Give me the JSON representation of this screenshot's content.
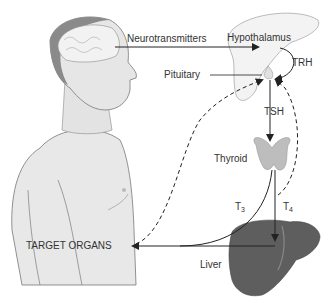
{
  "diagram": {
    "labels": {
      "neurotransmitters": "Neurotransmitters",
      "hypothalamus": "Hypothalamus",
      "trh": "TRH",
      "pituitary": "Pituitary",
      "tsh": "TSH",
      "thyroid": "Thyroid",
      "t3_base": "T",
      "t3_sub": "3",
      "t4_base": "T",
      "t4_sub": "4",
      "target_organs": "TARGET ORGANS",
      "liver": "Liver"
    },
    "nodes": [
      "Brain",
      "Hypothalamus",
      "Pituitary",
      "Thyroid",
      "Liver",
      "Target Organs"
    ],
    "edges": [
      {
        "from": "Brain",
        "to": "Hypothalamus",
        "label": "Neurotransmitters",
        "style": "solid"
      },
      {
        "from": "Hypothalamus",
        "to": "Pituitary",
        "label": "TRH",
        "style": "solid"
      },
      {
        "from": "Pituitary",
        "to": "Thyroid",
        "label": "TSH",
        "style": "solid"
      },
      {
        "from": "Thyroid",
        "to": "Target Organs",
        "label": "T3",
        "style": "solid"
      },
      {
        "from": "Thyroid",
        "to": "Liver",
        "label": "T4",
        "style": "solid"
      },
      {
        "from": "Liver",
        "to": "Target Organs",
        "label": "",
        "style": "solid"
      },
      {
        "from": "Target Organs",
        "to": "Pituitary",
        "label": "",
        "style": "dashed"
      },
      {
        "from": "Thyroid",
        "to": "Pituitary",
        "label": "",
        "style": "dashed"
      }
    ],
    "colors": {
      "background": "#ffffff",
      "skin": "#e6e6e6",
      "hair": "#8a8a8a",
      "brain": "#f0f0f0",
      "thyroid": "#bdbdbd",
      "liver": "#5e5e5e",
      "arrow": "#222222",
      "text": "#333333"
    }
  }
}
